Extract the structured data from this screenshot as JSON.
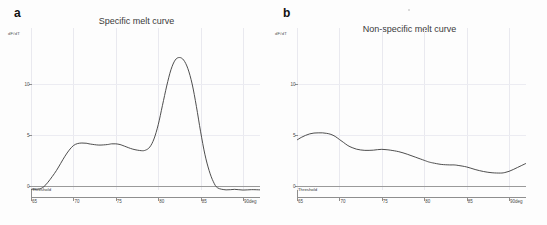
{
  "figure": {
    "background": "#fdfdfd",
    "curve_color": "#3a3a3a",
    "axis_color": "#8e8e8e",
    "grid_color": "#ececf2",
    "threshold_color": "#9a9a9a"
  },
  "panels": [
    {
      "label": "a",
      "title": "Specific melt curve",
      "ylabel": "dF/dT",
      "xaxis_unit": "deg",
      "threshold_label": "Threshold"
    },
    {
      "label": "b",
      "title": "Non-specific melt curve",
      "ylabel": "dF/dT",
      "xaxis_unit": "deg",
      "threshold_label": "Threshold"
    }
  ],
  "chart_data": [
    {
      "type": "line",
      "title": "Specific melt curve",
      "panel": "a",
      "xlabel": "deg",
      "ylabel": "dF/dT",
      "xlim": [
        65,
        92
      ],
      "ylim": [
        -1.2,
        15.5
      ],
      "xticks": [
        65,
        70,
        75,
        80,
        85,
        90
      ],
      "yticks": [
        0,
        5,
        10
      ],
      "grid": true,
      "legend": "none",
      "annotations": [
        {
          "text": "Threshold",
          "y": 0,
          "type": "horizontal-line"
        }
      ],
      "x": [
        65.0,
        66.0,
        66.5,
        67.0,
        67.5,
        68.0,
        68.5,
        69.0,
        69.5,
        70.0,
        70.5,
        71.0,
        71.5,
        72.0,
        73.0,
        74.0,
        74.5,
        75.0,
        75.5,
        76.0,
        77.0,
        78.0,
        78.5,
        79.0,
        79.5,
        80.0,
        80.5,
        81.0,
        81.5,
        82.0,
        82.5,
        83.0,
        83.5,
        84.0,
        84.5,
        85.0,
        85.5,
        86.0,
        86.5,
        87.0,
        88.0,
        89.0,
        90.0,
        91.0,
        92.0
      ],
      "y": [
        -0.35,
        -0.3,
        -0.1,
        0.35,
        0.9,
        1.5,
        2.2,
        2.9,
        3.5,
        3.95,
        4.15,
        4.2,
        4.18,
        4.1,
        4.0,
        4.05,
        4.12,
        4.12,
        4.05,
        3.9,
        3.6,
        3.45,
        3.5,
        3.8,
        4.6,
        6.0,
        7.9,
        9.8,
        11.4,
        12.35,
        12.6,
        12.35,
        11.5,
        10.0,
        7.8,
        5.3,
        3.1,
        1.5,
        0.4,
        -0.2,
        -0.4,
        -0.35,
        -0.42,
        -0.38,
        -0.4
      ]
    },
    {
      "type": "line",
      "title": "Non-specific melt curve",
      "panel": "b",
      "xlabel": "deg",
      "ylabel": "dF/dT",
      "xlim": [
        65,
        92
      ],
      "ylim": [
        -1.2,
        15.5
      ],
      "xticks": [
        65,
        70,
        75,
        80,
        85,
        90
      ],
      "yticks": [
        0,
        5,
        10
      ],
      "grid": true,
      "legend": "none",
      "annotations": [
        {
          "text": "Threshold",
          "y": 0,
          "type": "horizontal-line"
        }
      ],
      "x": [
        65.0,
        65.5,
        66.0,
        66.5,
        67.0,
        67.5,
        68.0,
        68.5,
        69.0,
        69.5,
        70.0,
        70.5,
        71.0,
        71.5,
        72.0,
        72.5,
        73.0,
        73.5,
        74.0,
        74.5,
        75.0,
        75.5,
        76.0,
        77.0,
        78.0,
        79.0,
        80.0,
        80.5,
        81.0,
        82.0,
        83.0,
        83.5,
        84.0,
        85.0,
        86.0,
        87.0,
        88.0,
        89.0,
        89.5,
        90.0,
        90.5,
        91.0,
        91.5,
        92.0
      ],
      "y": [
        4.5,
        4.75,
        4.95,
        5.1,
        5.18,
        5.2,
        5.2,
        5.15,
        5.05,
        4.85,
        4.55,
        4.25,
        3.95,
        3.75,
        3.6,
        3.52,
        3.48,
        3.48,
        3.5,
        3.55,
        3.58,
        3.55,
        3.5,
        3.35,
        3.1,
        2.8,
        2.5,
        2.35,
        2.25,
        2.1,
        2.05,
        2.05,
        2.0,
        1.85,
        1.6,
        1.4,
        1.28,
        1.25,
        1.3,
        1.42,
        1.6,
        1.8,
        2.0,
        2.2
      ]
    }
  ]
}
